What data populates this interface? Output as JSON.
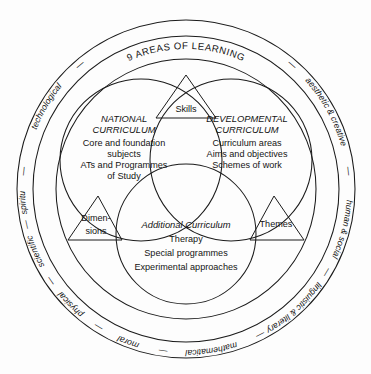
{
  "figure": {
    "ring_title": "9 AREAS OF LEARNING",
    "separator": "—",
    "areas_of_learning": [
      "technological",
      "spiritual",
      "scientific",
      "physical",
      "moral",
      "mathematical",
      "linguistic & literary",
      "human & social",
      "aesthetic & creative"
    ],
    "circles": [
      {
        "id": "national-curriculum",
        "title_line1": "NATIONAL",
        "title_line2": "CURRICULUM",
        "lines": [
          "Core and foundation",
          "subjects",
          "ATs and Programmes",
          "of Study"
        ]
      },
      {
        "id": "developmental-curriculum",
        "title_line1": "DEVELOPMENTAL",
        "title_line2": "CURRICULUM",
        "lines": [
          "Curriculum areas",
          "Aims and objectives",
          "Schemes of work"
        ]
      },
      {
        "id": "additional-curriculum",
        "title_line1": "Additional Curriculum",
        "title_line2": "",
        "lines": [
          "Therapy",
          "Special programmes",
          "Experimental approaches"
        ]
      }
    ],
    "triangles": [
      {
        "id": "skills",
        "line1": "Skills",
        "line2": ""
      },
      {
        "id": "dimensions",
        "line1": "Dimen-",
        "line2": "sions"
      },
      {
        "id": "themes",
        "line1": "Themes",
        "line2": ""
      }
    ],
    "colors": {
      "ink": "#1b1b1b",
      "background": "#fdfdfd"
    }
  }
}
